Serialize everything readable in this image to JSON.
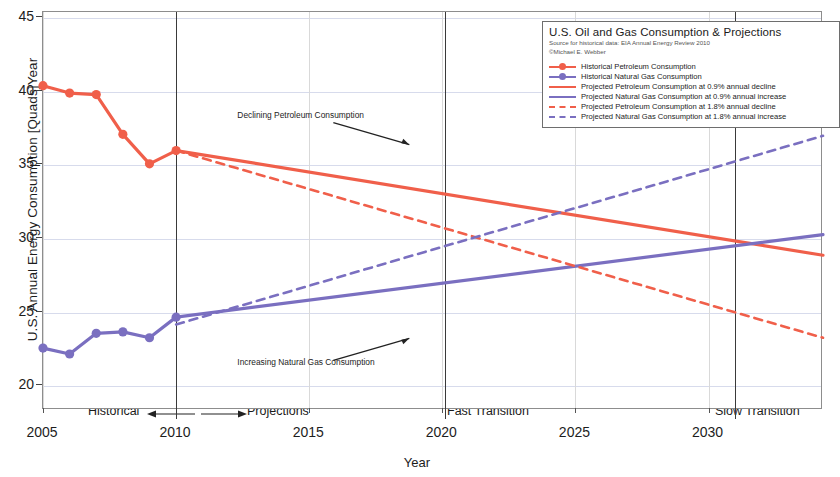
{
  "chart_data": {
    "type": "line",
    "title": "U.S. Oil and Gas Consumption & Projections",
    "subtitle_1": "Source for historical data: EIA Annual Energy Review 2010",
    "subtitle_2": "©Michael E. Webber",
    "xlabel": "Year",
    "ylabel": "U.S. Annual Energy Consumption [Quads]Year",
    "xlim": [
      2005,
      2034.3
    ],
    "ylim": [
      18.4,
      45.4
    ],
    "xticks": [
      2005,
      2010,
      2015,
      2020,
      2025,
      2030
    ],
    "xtick_labels": [
      "2005",
      "2010",
      "2015",
      "2020",
      "2025",
      "2030"
    ],
    "yticks": [
      20,
      25,
      30,
      35,
      40,
      45
    ],
    "ytick_labels": [
      "20",
      "25",
      "30",
      "35",
      "40",
      "45"
    ],
    "grid": "horizontal gridlines at y ticks, light vertical gridlines at x ticks",
    "legend_position": "top-right inside plot",
    "colors": {
      "petroleum": "#f05f4a",
      "natural_gas": "#7a6fc0",
      "marker_line": "#3a3a3a",
      "grid": "#c9cfe6",
      "frame": "#8d8d8d"
    },
    "series": [
      {
        "name": "Historical Petroleum Consumption",
        "style": "solid-with-markers",
        "color": "#f05f4a",
        "x": [
          2005,
          2006,
          2007,
          2008,
          2009,
          2010
        ],
        "values": [
          40.4,
          39.9,
          39.8,
          37.1,
          35.1,
          36.0
        ]
      },
      {
        "name": "Historical Natural Gas Consumption",
        "style": "solid-with-markers",
        "color": "#7a6fc0",
        "x": [
          2005,
          2006,
          2007,
          2008,
          2009,
          2010
        ],
        "values": [
          22.6,
          22.2,
          23.6,
          23.7,
          23.3,
          24.7
        ]
      },
      {
        "name": "Projected Petroleum Consumption at 0.9% annual decline",
        "style": "solid",
        "color": "#f05f4a",
        "x": [
          2010,
          2034.3
        ],
        "values": [
          36.0,
          28.9
        ]
      },
      {
        "name": "Projected Natural Gas Consumption at 0.9% annual increase",
        "style": "solid",
        "color": "#7a6fc0",
        "x": [
          2010,
          2034.3
        ],
        "values": [
          24.7,
          30.3
        ]
      },
      {
        "name": "Projected Petroleum Consumption at 1.8% annual decline",
        "style": "dashed",
        "color": "#f05f4a",
        "x": [
          2010,
          2034.3
        ],
        "values": [
          36.0,
          23.3
        ]
      },
      {
        "name": "Projected Natural Gas Consumption at 1.8% annual increase",
        "style": "dashed",
        "color": "#7a6fc0",
        "x": [
          2010,
          2034.3
        ],
        "values": [
          24.2,
          37.0
        ]
      }
    ],
    "vertical_markers": [
      {
        "label": "",
        "x": 2010
      },
      {
        "label": "Fast Transition",
        "x": 2020.1
      },
      {
        "label": "Slow Transition",
        "x": 2031.0
      }
    ],
    "annotations": [
      {
        "text": "Declining Petroleum Consumption",
        "x": 2012.3,
        "y": 38.3,
        "arrow": "down-right"
      },
      {
        "text": "Increasing Natural Gas Consumption",
        "x": 2012.3,
        "y": 21.5,
        "arrow": "up-right"
      }
    ],
    "axis_annotations": {
      "historical": "Historical",
      "projections": "Projections",
      "fast_transition": "Fast Transition",
      "slow_transition": "Slow Transition"
    }
  }
}
